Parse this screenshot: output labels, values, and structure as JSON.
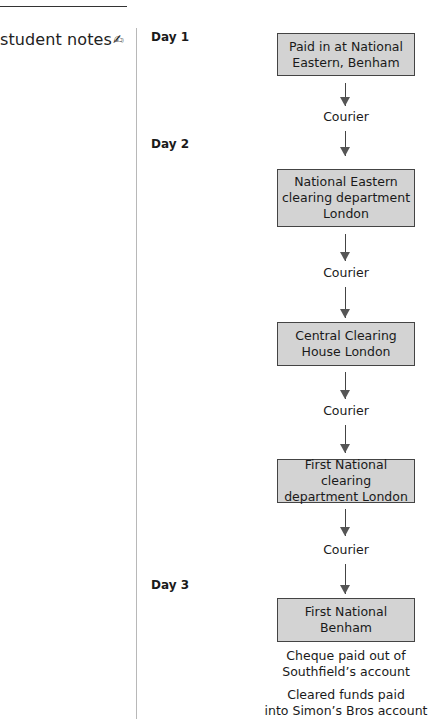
{
  "margin": {
    "label": "student notes",
    "icon": "pen-writing-icon",
    "icon_glyph": "✍"
  },
  "days": [
    {
      "label": "Day 1"
    },
    {
      "label": "Day 2"
    },
    {
      "label": "Day 3"
    }
  ],
  "steps": [
    {
      "lines": [
        "Paid in at National",
        "Eastern, Benham"
      ]
    },
    {
      "lines": [
        "National Eastern",
        "clearing department",
        "London"
      ]
    },
    {
      "lines": [
        "Central Clearing",
        "House London"
      ]
    },
    {
      "lines": [
        "First National clearing",
        "department London"
      ]
    },
    {
      "lines": [
        "First National",
        "Benham"
      ]
    }
  ],
  "transfers": [
    {
      "label": "Courier"
    },
    {
      "label": "Courier"
    },
    {
      "label": "Courier"
    },
    {
      "label": "Courier"
    }
  ],
  "outcomes": [
    {
      "lines": [
        "Cheque paid out of",
        "Southfield’s account"
      ]
    },
    {
      "lines": [
        "Cleared funds paid",
        "into Simon’s Bros account"
      ]
    }
  ],
  "colors": {
    "box_fill": "#d3d3d3",
    "box_border": "#444444",
    "arrow": "#555555",
    "margin_line": "#b8b8b8"
  }
}
